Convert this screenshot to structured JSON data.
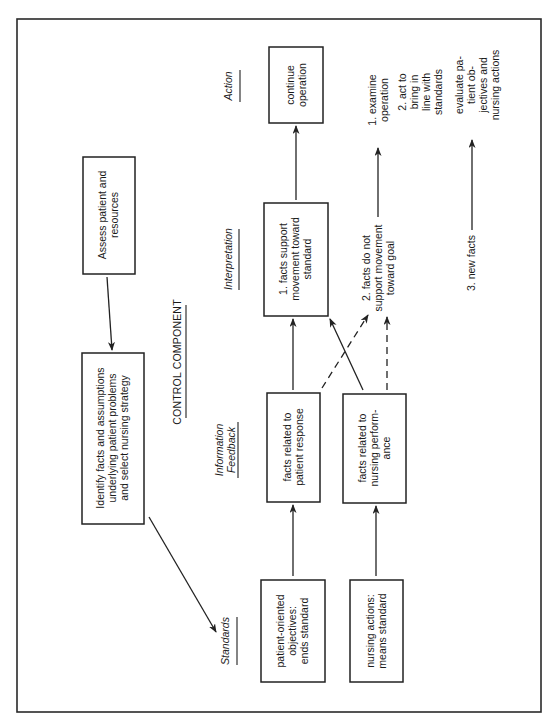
{
  "diagram": {
    "title": "CONTROL COMPONENT",
    "orientation": "rotated 90 degrees counterclockwise",
    "column_headers": {
      "standards": "Standards",
      "information_feedback": [
        "Information",
        "Feedback"
      ],
      "interpretation": "Interpretation",
      "action": "Action"
    },
    "boxes": {
      "assess": [
        "Assess patient and",
        "resources"
      ],
      "identify": [
        "Identify facts and assumptions",
        "underlying patient problems",
        "and select nursing strategy"
      ],
      "patient_objectives": [
        "patient-oriented",
        "objectives:",
        "ends standard"
      ],
      "nursing_actions": [
        "nursing actions:",
        "means standard"
      ],
      "facts_patient": [
        "facts related to",
        "patient response"
      ],
      "facts_nursing": [
        "facts related to",
        "nursing perform-",
        "ance"
      ],
      "facts_support": [
        "1. facts support",
        "movement toward",
        "standard"
      ],
      "continue": [
        "continue",
        "operation"
      ]
    },
    "labels": {
      "facts_not_support": [
        "2. facts do not",
        "support movement",
        "toward goal"
      ],
      "new_facts": "3. new facts",
      "examine": [
        "1. examine",
        "operation"
      ],
      "act": [
        "2. act to",
        "bring in",
        "line with",
        "standards"
      ],
      "evaluate": [
        "evaluate pa-",
        "tient ob-",
        "jectives and",
        "nursing actions"
      ]
    },
    "colors": {
      "ink": "#222222",
      "background": "#ffffff"
    }
  }
}
